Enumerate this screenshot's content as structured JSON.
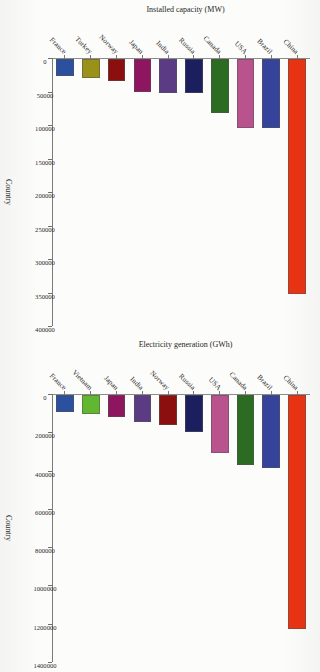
{
  "document": {
    "background_color": "#fcfcfa",
    "orientation": "rotated-90-clockwise",
    "panel_count": 2
  },
  "chart_data": [
    {
      "id": "installed-capacity",
      "type": "bar",
      "orientation": "vertical-categories-horizontal-bars",
      "title": "",
      "xlabel": "Country",
      "ylabel": "Installed capacity (MW)",
      "ylim": [
        0,
        400000
      ],
      "yticks": [
        0,
        50000,
        100000,
        150000,
        200000,
        250000,
        300000,
        350000,
        400000
      ],
      "ytick_labels": [
        "0",
        "50000",
        "100000",
        "150000",
        "200000",
        "250000",
        "300000",
        "350000",
        "400000"
      ],
      "grid": false,
      "legend": "none",
      "categories": [
        "China",
        "Brazil",
        "USA",
        "Canada",
        "Russia",
        "India",
        "Japan",
        "Norway",
        "Turkey",
        "France"
      ],
      "values": [
        352000,
        104000,
        103000,
        81000,
        51000,
        51000,
        50000,
        33000,
        29000,
        26000
      ],
      "colors": [
        "#ea3413",
        "#35449a",
        "#b9538e",
        "#2b6b22",
        "#1c1f5e",
        "#5b3c84",
        "#8e1560",
        "#8c0f0f",
        "#9a9118",
        "#2c4f9e"
      ]
    },
    {
      "id": "electricity-generation",
      "type": "bar",
      "orientation": "vertical-categories-horizontal-bars",
      "title": "",
      "xlabel": "Country",
      "ylabel": "Electricity generation (GWh)",
      "ylim": [
        0,
        1400000
      ],
      "yticks": [
        0,
        200000,
        400000,
        600000,
        800000,
        1000000,
        1200000,
        1400000
      ],
      "ytick_labels": [
        "0",
        "200000",
        "400000",
        "600000",
        "800000",
        "1000000",
        "1200000",
        "1400000"
      ],
      "grid": false,
      "legend": "none",
      "categories": [
        "China",
        "Brazil",
        "Canada",
        "USA",
        "Russia",
        "Norway",
        "India",
        "Japan",
        "Vietnam",
        "France"
      ],
      "values": [
        1225000,
        383000,
        367000,
        306000,
        196000,
        159000,
        142000,
        115000,
        99000,
        88000
      ],
      "colors": [
        "#ea3413",
        "#35449a",
        "#2b6b22",
        "#b9538e",
        "#1c1f5e",
        "#8c0f0f",
        "#5b3c84",
        "#8e1560",
        "#62b731",
        "#2c4f9e"
      ]
    }
  ]
}
